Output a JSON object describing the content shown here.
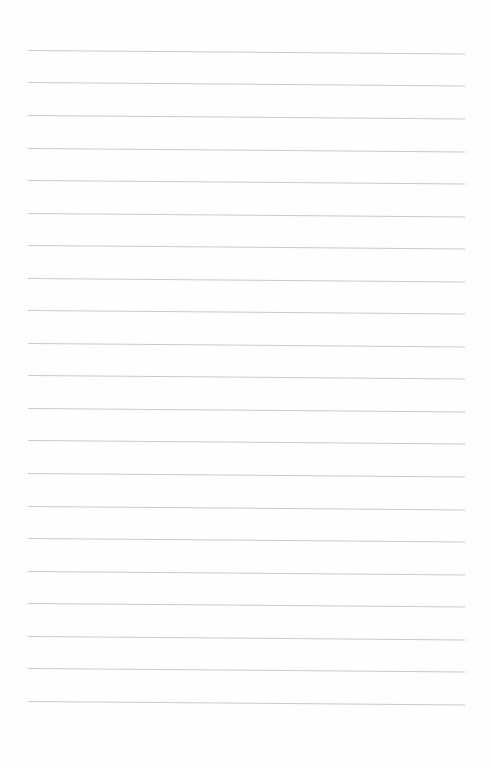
{
  "page": {
    "type": "lined-paper",
    "background_color": "#fefefe",
    "rule_color": "#c9c9c9",
    "rule_count": 21,
    "rules_y": [
      50,
      82,
      115,
      148,
      180,
      213,
      245,
      278,
      310,
      343,
      375,
      408,
      440,
      473,
      506,
      538,
      571,
      603,
      636,
      668,
      701
    ]
  }
}
